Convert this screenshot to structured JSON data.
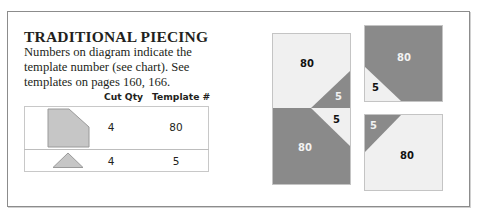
{
  "section": {
    "title": "TRADITIONAL PIECING",
    "description": "Numbers on diagram indicate the template number (see chart). See templates on pages 160, 166."
  },
  "chart": {
    "headers": [
      "Cut Qty",
      "Template #"
    ],
    "rows": [
      {
        "shape": "pentagon-clipped-corner",
        "cut_qty": "4",
        "template": "80"
      },
      {
        "shape": "triangle",
        "cut_qty": "4",
        "template": "5"
      }
    ]
  },
  "diagram": {
    "colors": {
      "dark": "#8a8a8a",
      "light": "#f0f0f0",
      "border": "#c4c4c4"
    },
    "blocks": [
      {
        "id": "tall-block",
        "labels": [
          "80",
          "5",
          "5",
          "80"
        ]
      },
      {
        "id": "top-right-block",
        "labels": [
          "80",
          "5"
        ]
      },
      {
        "id": "bottom-right-block",
        "labels": [
          "5",
          "80"
        ]
      }
    ]
  }
}
